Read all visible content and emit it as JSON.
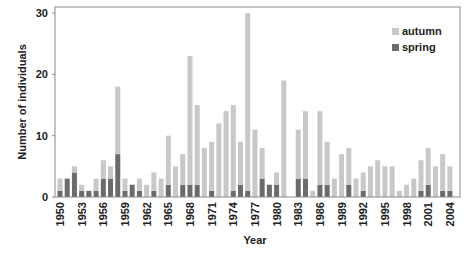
{
  "chart_data": {
    "type": "bar",
    "stacked": true,
    "title": "",
    "xlabel": "Year",
    "ylabel": "Number of individuals",
    "ylim": [
      0,
      31
    ],
    "yticks": [
      0,
      10,
      20,
      30
    ],
    "xtick_labels": [
      "1950",
      "1953",
      "1956",
      "1959",
      "1962",
      "1965",
      "1968",
      "1971",
      "1974",
      "1977",
      "1980",
      "1983",
      "1986",
      "1989",
      "1992",
      "1995",
      "1998",
      "2001",
      "2004"
    ],
    "grid": false,
    "legend_position": "top-right",
    "categories": [
      "1950",
      "1951",
      "1952",
      "1953",
      "1954",
      "1955",
      "1956",
      "1957",
      "1958",
      "1959",
      "1960",
      "1961",
      "1962",
      "1963",
      "1964",
      "1965",
      "1966",
      "1967",
      "1968",
      "1969",
      "1970",
      "1971",
      "1972",
      "1973",
      "1974",
      "1975",
      "1976",
      "1977",
      "1978",
      "1979",
      "1980",
      "1981",
      "1982",
      "1983",
      "1984",
      "1985",
      "1986",
      "1987",
      "1988",
      "1989",
      "1990",
      "1991",
      "1992",
      "1993",
      "1994",
      "1995",
      "1996",
      "1997",
      "1998",
      "1999",
      "2000",
      "2001",
      "2002",
      "2003",
      "2004"
    ],
    "series": [
      {
        "name": "spring",
        "color": "#6b6b6b",
        "values": [
          1,
          3,
          4,
          1,
          1,
          1,
          3,
          3,
          7,
          1,
          2,
          1,
          0,
          1,
          0,
          2,
          0,
          2,
          2,
          2,
          0,
          1,
          0,
          0,
          1,
          2,
          1,
          0,
          3,
          2,
          2,
          0,
          0,
          3,
          3,
          0,
          2,
          2,
          0,
          0,
          2,
          0,
          1,
          0,
          0,
          0,
          0,
          0,
          0,
          0,
          1,
          2,
          0,
          1,
          1
        ]
      },
      {
        "name": "autumn",
        "color": "#c8c8c8",
        "values": [
          2,
          0,
          1,
          1,
          0,
          2,
          3,
          2,
          11,
          2,
          0,
          2,
          2,
          3,
          3,
          8,
          5,
          5,
          21,
          13,
          8,
          8,
          12,
          14,
          14,
          7,
          29,
          11,
          5,
          0,
          2,
          19,
          0,
          8,
          11,
          1,
          12,
          7,
          3,
          7,
          6,
          3,
          3,
          5,
          6,
          5,
          5,
          1,
          2,
          3,
          5,
          6,
          5,
          6,
          4
        ]
      }
    ],
    "totals": [
      3,
      3,
      5,
      2,
      1,
      3,
      6,
      5,
      18,
      3,
      2,
      3,
      2,
      4,
      3,
      10,
      5,
      7,
      23,
      15,
      8,
      9,
      12,
      14,
      15,
      9,
      30,
      11,
      8,
      2,
      4,
      19,
      0,
      11,
      14,
      1,
      14,
      9,
      3,
      7,
      8,
      3,
      4,
      5,
      6,
      5,
      5,
      1,
      2,
      3,
      6,
      8,
      5,
      7,
      5
    ]
  },
  "legend": {
    "items": [
      {
        "label": "autumn",
        "color": "#c8c8c8"
      },
      {
        "label": "spring",
        "color": "#6b6b6b"
      }
    ]
  },
  "axes": {
    "x_title": "Year",
    "y_title": "Number of individuals"
  }
}
